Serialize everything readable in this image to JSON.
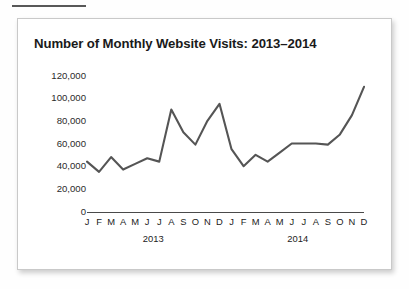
{
  "page": {
    "background_color": "#fefefe",
    "top_rule_color": "#585858"
  },
  "card": {
    "border_color": "#c9c9c9",
    "background_color": "#ffffff"
  },
  "chart_data": {
    "type": "line",
    "title": "Number of Monthly Website Visits: 2013–2014",
    "xlabel": "",
    "ylabel": "",
    "ylim": [
      0,
      120000
    ],
    "grid": false,
    "legend": "none",
    "line_color": "#555555",
    "tick_label_color": "#2b2b2b",
    "ytick_labels": [
      "120,000",
      "100,000",
      "80,000",
      "60,000",
      "40,000",
      "20,000",
      "0"
    ],
    "ytick_values": [
      120000,
      100000,
      80000,
      60000,
      40000,
      20000,
      0
    ],
    "categories": [
      "J",
      "F",
      "M",
      "A",
      "M",
      "J",
      "J",
      "A",
      "S",
      "O",
      "N",
      "D",
      "J",
      "F",
      "M",
      "A",
      "M",
      "J",
      "J",
      "A",
      "S",
      "O",
      "N",
      "D"
    ],
    "group_labels": [
      "2013",
      "2014"
    ],
    "x_full_labels": [
      "Jan 2013",
      "Feb 2013",
      "Mar 2013",
      "Apr 2013",
      "May 2013",
      "Jun 2013",
      "Jul 2013",
      "Aug 2013",
      "Sep 2013",
      "Oct 2013",
      "Nov 2013",
      "Dec 2013",
      "Jan 2014",
      "Feb 2014",
      "Mar 2014",
      "Apr 2014",
      "May 2014",
      "Jun 2014",
      "Jul 2014",
      "Aug 2014",
      "Sep 2014",
      "Oct 2014",
      "Nov 2014",
      "Dec 2014"
    ],
    "values": [
      44000,
      35000,
      48000,
      37000,
      42000,
      47000,
      44000,
      90000,
      70000,
      59000,
      80000,
      95000,
      55000,
      40000,
      50000,
      44000,
      52000,
      60000,
      60000,
      60000,
      59000,
      68000,
      85000,
      110000
    ]
  }
}
